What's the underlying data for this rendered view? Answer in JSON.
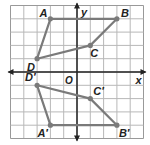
{
  "diagram": {
    "type": "coordinate-plane-reflection",
    "grid": {
      "xmin": -5,
      "xmax": 5,
      "ymin": -5,
      "ymax": 5,
      "cell_px": 13.3,
      "origin_px": [
        77,
        72
      ],
      "line_color": "#b8b8b8",
      "border_color": "#999999"
    },
    "axes": {
      "x_label": "x",
      "y_label": "y",
      "origin_label": "O",
      "color": "#222222"
    },
    "polygon_color": "#7a7a7a",
    "original": {
      "points": [
        {
          "name": "A",
          "x": -2,
          "y": 4
        },
        {
          "name": "B",
          "x": 3,
          "y": 4
        },
        {
          "name": "C",
          "x": 1,
          "y": 2
        },
        {
          "name": "D",
          "x": -3,
          "y": 1
        }
      ]
    },
    "image": {
      "points": [
        {
          "name": "A′",
          "x": -2,
          "y": -4
        },
        {
          "name": "B′",
          "x": 3,
          "y": -4
        },
        {
          "name": "C′",
          "x": 1,
          "y": -2
        },
        {
          "name": "D′",
          "x": -3,
          "y": -1
        }
      ]
    }
  }
}
